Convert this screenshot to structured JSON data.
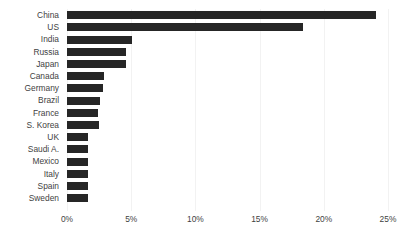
{
  "chart_data": {
    "type": "bar",
    "orientation": "horizontal",
    "title": "",
    "subtitle": "",
    "xlabel": "",
    "ylabel": "",
    "xlim": [
      0,
      25
    ],
    "xunit": "%",
    "grid": true,
    "legend": false,
    "bar_color": "#262626",
    "gridline_color": "#f2f2f2",
    "background_color": "#ffffff",
    "categories": [
      "China",
      "US",
      "India",
      "Russia",
      "Japan",
      "Canada",
      "Germany",
      "Brazil",
      "France",
      "S. Korea",
      "UK",
      "Saudi A.",
      "Mexico",
      "Italy",
      "Spain",
      "Sweden"
    ],
    "values": [
      24.1,
      18.4,
      5.1,
      4.6,
      4.6,
      2.9,
      2.8,
      2.6,
      2.4,
      2.5,
      1.6,
      1.6,
      1.6,
      1.6,
      1.6,
      1.6
    ],
    "xticks": [
      0,
      5,
      10,
      15,
      20,
      25
    ],
    "xticklabels": [
      "0%",
      "5%",
      "10%",
      "15%",
      "20%",
      "25%"
    ]
  }
}
